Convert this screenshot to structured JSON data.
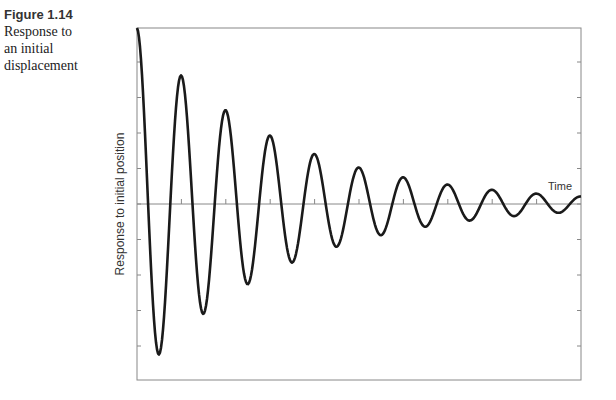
{
  "caption": {
    "figure_number": "Figure 1.14",
    "lines": [
      "Response to",
      "an initial",
      "displacement"
    ]
  },
  "chart_data": {
    "type": "line",
    "title": "Response to an initial displacement",
    "xlabel": "Time",
    "ylabel": "Response to initial position",
    "grid": false,
    "legend": null,
    "x_ticks_count": 10,
    "y_ticks_count": 9,
    "tick_labels": [],
    "series": [
      {
        "name": "response",
        "model": "y = A0 * exp(-d*t) * cos(2*pi*t/T)",
        "A0": 1.0,
        "period_cycles": 1.0,
        "decay_ratio_per_cycle": 0.73,
        "points": [
          {
            "t": 0.0,
            "y": 1.0
          },
          {
            "t": 0.5,
            "y": -0.86
          },
          {
            "t": 1.0,
            "y": 0.73
          },
          {
            "t": 1.5,
            "y": -0.64
          },
          {
            "t": 2.0,
            "y": 0.53
          },
          {
            "t": 2.5,
            "y": -0.46
          },
          {
            "t": 3.0,
            "y": 0.39
          },
          {
            "t": 3.5,
            "y": -0.34
          },
          {
            "t": 4.0,
            "y": 0.28
          },
          {
            "t": 4.5,
            "y": -0.25
          },
          {
            "t": 5.0,
            "y": 0.2
          },
          {
            "t": 5.5,
            "y": -0.18
          },
          {
            "t": 6.0,
            "y": 0.15
          },
          {
            "t": 6.5,
            "y": -0.14
          },
          {
            "t": 7.0,
            "y": 0.11
          },
          {
            "t": 7.5,
            "y": -0.1
          },
          {
            "t": 8.0,
            "y": 0.07
          },
          {
            "t": 8.5,
            "y": -0.06
          },
          {
            "t": 9.0,
            "y": 0.05
          },
          {
            "t": 9.5,
            "y": -0.05
          },
          {
            "t": 10.0,
            "y": 0.04
          }
        ]
      }
    ],
    "xlim": [
      0,
      10
    ],
    "ylim": [
      -1.0,
      1.0
    ]
  },
  "style": {
    "curve_color": "#1a1a1a",
    "axis_color": "#777777"
  }
}
